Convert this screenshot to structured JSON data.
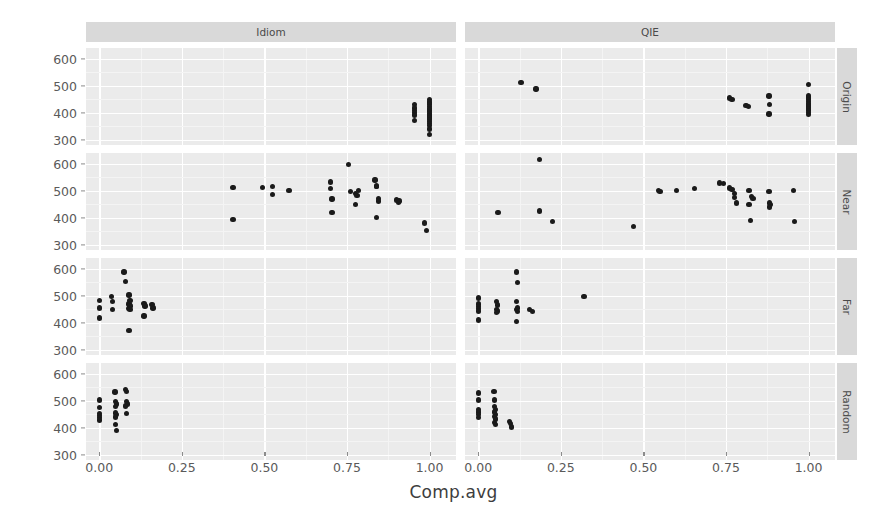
{
  "chart_data": {
    "type": "scatter",
    "title": "",
    "xlabel": "Comp.avg",
    "ylabel": "RT.avg",
    "xlim": [
      -0.04,
      1.08
    ],
    "ylim": [
      280,
      640
    ],
    "xticks": [
      "0.00",
      "0.25",
      "0.50",
      "0.75",
      "1.00"
    ],
    "xtick_values": [
      0.0,
      0.25,
      0.5,
      0.75,
      1.0
    ],
    "yticks": [
      "300",
      "400",
      "500",
      "600"
    ],
    "ytick_values": [
      300,
      400,
      500,
      600
    ],
    "grid": true,
    "legend": "none",
    "facet_cols": [
      "Idiom",
      "QIE"
    ],
    "facet_rows": [
      "Origin",
      "Near",
      "Far",
      "Random"
    ],
    "panels": [
      {
        "col": "Idiom",
        "row": "Origin",
        "points": [
          [
            0.955,
            430
          ],
          [
            0.955,
            418
          ],
          [
            0.955,
            408
          ],
          [
            0.955,
            400
          ],
          [
            0.955,
            392
          ],
          [
            0.955,
            370
          ],
          [
            1.0,
            448
          ],
          [
            1.0,
            440
          ],
          [
            1.0,
            432
          ],
          [
            1.0,
            424
          ],
          [
            1.0,
            416
          ],
          [
            1.0,
            410
          ],
          [
            1.0,
            404
          ],
          [
            1.0,
            398
          ],
          [
            1.0,
            392
          ],
          [
            1.0,
            386
          ],
          [
            1.0,
            380
          ],
          [
            1.0,
            374
          ],
          [
            1.0,
            368
          ],
          [
            1.0,
            360
          ],
          [
            1.0,
            352
          ],
          [
            1.0,
            340
          ],
          [
            1.0,
            318
          ]
        ]
      },
      {
        "col": "Idiom",
        "row": "Near",
        "points": [
          [
            0.405,
            512
          ],
          [
            0.405,
            393
          ],
          [
            0.495,
            512
          ],
          [
            0.525,
            515
          ],
          [
            0.525,
            487
          ],
          [
            0.575,
            500
          ],
          [
            0.7,
            533
          ],
          [
            0.7,
            508
          ],
          [
            0.705,
            470
          ],
          [
            0.705,
            420
          ],
          [
            0.755,
            598
          ],
          [
            0.76,
            498
          ],
          [
            0.775,
            490
          ],
          [
            0.78,
            483
          ],
          [
            0.785,
            501
          ],
          [
            0.775,
            450
          ],
          [
            0.835,
            540
          ],
          [
            0.84,
            517
          ],
          [
            0.84,
            515
          ],
          [
            0.845,
            472
          ],
          [
            0.845,
            462
          ],
          [
            0.84,
            400
          ],
          [
            0.9,
            465
          ],
          [
            0.905,
            457
          ],
          [
            0.908,
            462
          ],
          [
            0.985,
            380
          ],
          [
            0.99,
            352
          ]
        ]
      },
      {
        "col": "Idiom",
        "row": "Far",
        "points": [
          [
            0.0,
            483
          ],
          [
            0.0,
            455
          ],
          [
            0.0,
            417
          ],
          [
            0.038,
            498
          ],
          [
            0.04,
            478
          ],
          [
            0.04,
            450
          ],
          [
            0.075,
            588
          ],
          [
            0.08,
            552
          ],
          [
            0.09,
            502
          ],
          [
            0.093,
            482
          ],
          [
            0.09,
            470
          ],
          [
            0.093,
            462
          ],
          [
            0.09,
            452
          ],
          [
            0.093,
            448
          ],
          [
            0.09,
            372
          ],
          [
            0.135,
            472
          ],
          [
            0.138,
            462
          ],
          [
            0.135,
            425
          ],
          [
            0.16,
            468
          ],
          [
            0.163,
            455
          ]
        ]
      },
      {
        "col": "Idiom",
        "row": "Random",
        "points": [
          [
            0.0,
            502
          ],
          [
            0.0,
            475
          ],
          [
            0.0,
            452
          ],
          [
            0.0,
            445
          ],
          [
            0.0,
            438
          ],
          [
            0.0,
            428
          ],
          [
            0.048,
            532
          ],
          [
            0.05,
            498
          ],
          [
            0.052,
            488
          ],
          [
            0.05,
            478
          ],
          [
            0.05,
            455
          ],
          [
            0.052,
            448
          ],
          [
            0.05,
            440
          ],
          [
            0.05,
            412
          ],
          [
            0.052,
            390
          ],
          [
            0.08,
            542
          ],
          [
            0.082,
            535
          ],
          [
            0.082,
            497
          ],
          [
            0.085,
            488
          ],
          [
            0.08,
            480
          ],
          [
            0.082,
            452
          ]
        ]
      },
      {
        "col": "QIE",
        "row": "Origin",
        "points": [
          [
            0.13,
            512
          ],
          [
            0.175,
            488
          ],
          [
            0.76,
            455
          ],
          [
            0.768,
            448
          ],
          [
            0.81,
            427
          ],
          [
            0.818,
            422
          ],
          [
            0.88,
            462
          ],
          [
            0.882,
            430
          ],
          [
            0.88,
            395
          ],
          [
            1.0,
            505
          ],
          [
            1.0,
            462
          ],
          [
            1.0,
            455
          ],
          [
            1.0,
            448
          ],
          [
            1.0,
            441
          ],
          [
            1.0,
            434
          ],
          [
            1.0,
            428
          ],
          [
            1.0,
            421
          ],
          [
            1.0,
            414
          ],
          [
            1.0,
            407
          ],
          [
            1.0,
            400
          ],
          [
            1.0,
            393
          ]
        ]
      },
      {
        "col": "QIE",
        "row": "Near",
        "points": [
          [
            0.06,
            420
          ],
          [
            0.185,
            617
          ],
          [
            0.185,
            425
          ],
          [
            0.225,
            385
          ],
          [
            0.47,
            368
          ],
          [
            0.545,
            500
          ],
          [
            0.55,
            498
          ],
          [
            0.6,
            500
          ],
          [
            0.655,
            508
          ],
          [
            0.73,
            528
          ],
          [
            0.742,
            527
          ],
          [
            0.76,
            510
          ],
          [
            0.768,
            505
          ],
          [
            0.775,
            490
          ],
          [
            0.775,
            475
          ],
          [
            0.782,
            455
          ],
          [
            0.82,
            500
          ],
          [
            0.828,
            478
          ],
          [
            0.832,
            472
          ],
          [
            0.82,
            448
          ],
          [
            0.825,
            390
          ],
          [
            0.88,
            498
          ],
          [
            0.882,
            455
          ],
          [
            0.884,
            448
          ],
          [
            0.882,
            440
          ],
          [
            0.955,
            500
          ],
          [
            0.958,
            385
          ]
        ]
      },
      {
        "col": "QIE",
        "row": "Far",
        "points": [
          [
            0.0,
            492
          ],
          [
            0.0,
            470
          ],
          [
            0.0,
            460
          ],
          [
            0.0,
            452
          ],
          [
            0.0,
            444
          ],
          [
            0.0,
            410
          ],
          [
            0.055,
            478
          ],
          [
            0.058,
            465
          ],
          [
            0.055,
            450
          ],
          [
            0.058,
            444
          ],
          [
            0.055,
            438
          ],
          [
            0.115,
            588
          ],
          [
            0.118,
            548
          ],
          [
            0.115,
            478
          ],
          [
            0.118,
            455
          ],
          [
            0.115,
            448
          ],
          [
            0.118,
            442
          ],
          [
            0.115,
            405
          ],
          [
            0.155,
            448
          ],
          [
            0.165,
            442
          ],
          [
            0.32,
            498
          ]
        ]
      },
      {
        "col": "QIE",
        "row": "Random",
        "points": [
          [
            0.0,
            528
          ],
          [
            0.0,
            502
          ],
          [
            0.0,
            468
          ],
          [
            0.0,
            458
          ],
          [
            0.0,
            448
          ],
          [
            0.0,
            438
          ],
          [
            0.048,
            535
          ],
          [
            0.05,
            502
          ],
          [
            0.05,
            478
          ],
          [
            0.052,
            468
          ],
          [
            0.05,
            458
          ],
          [
            0.052,
            450
          ],
          [
            0.05,
            442
          ],
          [
            0.052,
            432
          ],
          [
            0.05,
            420
          ],
          [
            0.052,
            412
          ],
          [
            0.095,
            422
          ],
          [
            0.098,
            415
          ],
          [
            0.1,
            402
          ]
        ]
      }
    ]
  },
  "axes": {
    "y_title": "RT.avg",
    "x_title": "Comp.avg"
  }
}
